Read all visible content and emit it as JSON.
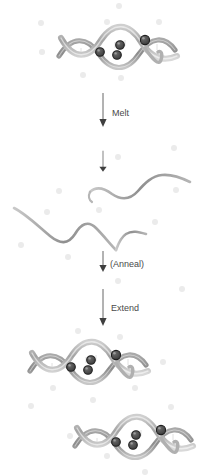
{
  "figure": {
    "kind": "dna-amplification-cycle-diagram",
    "background_color": "#ffffff",
    "background_dot_color": "#ebebeb",
    "strand_color": "#a8a8a8",
    "strand_shade_color": "#6e6e6e",
    "probe_fill_color": "#4f4f4f",
    "probe_stroke_color": "#1f1f1f",
    "arrow_color": "#555555",
    "label_color": "#4a4a4a"
  },
  "steps": [
    {
      "id": "melt",
      "label": "Melt"
    },
    {
      "id": "anneal",
      "label": "(Anneal)"
    },
    {
      "id": "extend",
      "label": "Extend"
    }
  ],
  "stages": [
    {
      "id": "duplex-top",
      "role": "double-stranded-dna-with-probes",
      "probe_count": 4
    },
    {
      "id": "melted-strands",
      "role": "separated-single-strands",
      "strand_count": 2,
      "probe_count": 0
    },
    {
      "id": "duplex-product-1",
      "role": "double-stranded-dna-with-probes",
      "probe_count": 4
    },
    {
      "id": "duplex-product-2",
      "role": "double-stranded-dna-with-probes",
      "probe_count": 4
    }
  ],
  "background_dots": [
    {
      "x": 119,
      "y": 6,
      "r": 3.0
    },
    {
      "x": 41,
      "y": 23,
      "r": 3.0
    },
    {
      "x": 107,
      "y": 22,
      "r": 3.2
    },
    {
      "x": 159,
      "y": 22,
      "r": 3.0
    },
    {
      "x": 42,
      "y": 52,
      "r": 2.8
    },
    {
      "x": 83,
      "y": 75,
      "r": 3.0
    },
    {
      "x": 121,
      "y": 78,
      "r": 3.0
    },
    {
      "x": 174,
      "y": 148,
      "r": 3.0
    },
    {
      "x": 59,
      "y": 191,
      "r": 3.0
    },
    {
      "x": 118,
      "y": 157,
      "r": 3.0
    },
    {
      "x": 176,
      "y": 190,
      "r": 3.0
    },
    {
      "x": 47,
      "y": 212,
      "r": 3.0
    },
    {
      "x": 99,
      "y": 210,
      "r": 3.0
    },
    {
      "x": 155,
      "y": 222,
      "r": 3.0
    },
    {
      "x": 21,
      "y": 245,
      "r": 3.0
    },
    {
      "x": 68,
      "y": 257,
      "r": 3.0
    },
    {
      "x": 118,
      "y": 281,
      "r": 3.0
    },
    {
      "x": 78,
      "y": 331,
      "r": 3.0
    },
    {
      "x": 120,
      "y": 337,
      "r": 3.0
    },
    {
      "x": 33,
      "y": 355,
      "r": 3.0
    },
    {
      "x": 163,
      "y": 362,
      "r": 3.0
    },
    {
      "x": 53,
      "y": 388,
      "r": 3.0
    },
    {
      "x": 135,
      "y": 388,
      "r": 3.0
    },
    {
      "x": 31,
      "y": 406,
      "r": 3.0
    },
    {
      "x": 93,
      "y": 400,
      "r": 3.0
    },
    {
      "x": 171,
      "y": 407,
      "r": 3.0
    },
    {
      "x": 70,
      "y": 436,
      "r": 3.0
    },
    {
      "x": 107,
      "y": 456,
      "r": 3.0
    },
    {
      "x": 145,
      "y": 472,
      "r": 3.0
    },
    {
      "x": 182,
      "y": 289,
      "r": 3.0
    }
  ]
}
